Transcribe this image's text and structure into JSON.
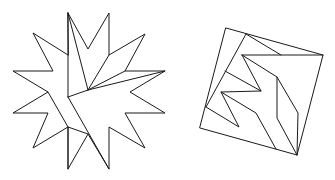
{
  "figure": {
    "title": "Dissection of a twelve-pointed star into a square",
    "stroke_color": "#1a1a1a",
    "background": "#ffffff",
    "star": {
      "label": "twelve-pointed star",
      "outline": "68,13 88,49 109,13 109,55 145,34 125,71 165,71 130,92 165,113 125,113 145,148 109,127 109,169 88,134 68,169 68,127 33,148 48,113 13,113 48,92 13,71 53,71 33,33 68,55",
      "cuts": [
        "68,13 88,90",
        "68,13 68,97",
        "68,97 88,90 165,71",
        "109,55 88,90",
        "125,71 88,90",
        "68,97 109,169",
        "48,92 68,127 88,134",
        "68,127 68,169"
      ]
    },
    "square": {
      "label": "assembled square",
      "outline": "226,28 323,55 297,155 200,128",
      "cuts": [
        "246,34 281,55",
        "246,34 206,107",
        "242,55 323,55",
        "242,55 261,91 225,71",
        "242,55 277,77 277,118 297,155",
        "277,77 298,113 297,155",
        "261,91 221,92 239,127 206,107",
        "221,92 256,113 276,149"
      ]
    }
  }
}
